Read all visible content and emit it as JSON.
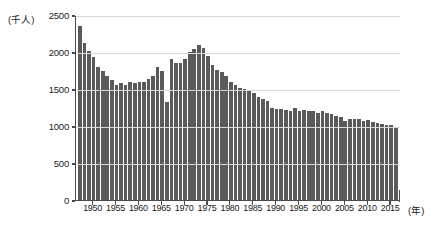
{
  "chart_data": {
    "type": "bar",
    "title": "",
    "xlabel": "年",
    "ylabel": "千人",
    "y_unit_label": "(千人)",
    "x_unit_label": "(年)",
    "ylim": [
      0,
      2500
    ],
    "grid": true,
    "legend": "none",
    "y_ticks": [
      0,
      500,
      1000,
      1500,
      2000,
      2500
    ],
    "y_tick_labels": [
      "0",
      "500",
      "1000",
      "1500",
      "2000",
      "2500"
    ],
    "x_ticks": [
      1950,
      1955,
      1960,
      1965,
      1970,
      1975,
      1980,
      1985,
      1990,
      1995,
      2000,
      2005,
      2010,
      2015
    ],
    "x_tick_labels": [
      "1950",
      "1955",
      "1960",
      "1965",
      "1970",
      "1975",
      "1980",
      "1985",
      "1990",
      "1995",
      "2000",
      "2005",
      "2010",
      "2015"
    ],
    "bar_color": "#5a5a5a",
    "grid_color": "#d8d8d8",
    "axis_color": "#4a4a4a",
    "series_name": "出生数",
    "categories": [
      1947,
      1948,
      1949,
      1950,
      1951,
      1952,
      1953,
      1954,
      1955,
      1956,
      1957,
      1958,
      1959,
      1960,
      1961,
      1962,
      1963,
      1964,
      1965,
      1966,
      1967,
      1968,
      1969,
      1970,
      1971,
      1972,
      1973,
      1974,
      1975,
      1976,
      1977,
      1978,
      1979,
      1980,
      1981,
      1982,
      1983,
      1984,
      1985,
      1986,
      1987,
      1988,
      1989,
      1990,
      1991,
      1992,
      1993,
      1994,
      1995,
      1996,
      1997,
      1998,
      1999,
      2000,
      2001,
      2002,
      2003,
      2004,
      2005,
      2006,
      2007,
      2008,
      2009,
      2010,
      2011,
      2012,
      2013,
      2014,
      2015,
      2016
    ],
    "values": [
      2350,
      2120,
      2020,
      1930,
      1800,
      1740,
      1680,
      1620,
      1560,
      1580,
      1550,
      1600,
      1580,
      1590,
      1600,
      1630,
      1680,
      1800,
      1740,
      1320,
      1900,
      1850,
      1850,
      1900,
      2000,
      2040,
      2090,
      2060,
      1950,
      1830,
      1760,
      1730,
      1680,
      1600,
      1550,
      1510,
      1500,
      1490,
      1440,
      1390,
      1360,
      1340,
      1250,
      1230,
      1230,
      1210,
      1200,
      1240,
      1200,
      1210,
      1200,
      1200,
      1180,
      1200,
      1180,
      1160,
      1130,
      1120,
      1070,
      1090,
      1090,
      1090,
      1070,
      1080,
      1050,
      1040,
      1030,
      1010,
      1010,
      977
    ]
  }
}
